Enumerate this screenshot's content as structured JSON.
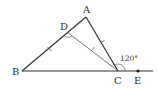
{
  "diagram": {
    "type": "geometry-triangle",
    "points": {
      "A": {
        "label": "A",
        "x": 86,
        "y": 17,
        "lx": 84,
        "ly": 13
      },
      "B": {
        "label": "B",
        "x": 22,
        "y": 71,
        "lx": 12,
        "ly": 75
      },
      "C": {
        "label": "C",
        "x": 118,
        "y": 71,
        "lx": 114,
        "ly": 84
      },
      "D": {
        "label": "D",
        "x": 67,
        "y": 32,
        "lx": 60,
        "ly": 30
      },
      "E": {
        "label": "E",
        "x": 138,
        "y": 71,
        "lx": 134,
        "ly": 84
      }
    },
    "angle_label": {
      "text": "120°",
      "x": 120,
      "y": 60
    },
    "colors": {
      "stroke": "#333333",
      "thin": "#555555",
      "background": "#ffffff"
    },
    "notes": {
      "equal_segments": "BD = DC = CA (tick marks)",
      "marked_angles": "angle ADC (arc), exterior angle ACE = 120°"
    }
  }
}
